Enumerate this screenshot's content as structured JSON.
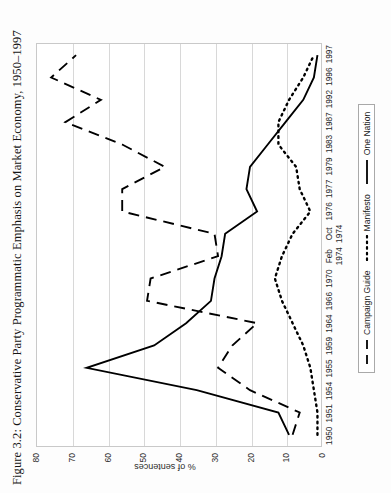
{
  "figure": {
    "title": "Figure 3.2: Conservative Party Programmatic Emphasis on Market Economy, 1950–1997"
  },
  "chart_data": {
    "type": "line",
    "title": "Figure 3.2: Conservative Party Programmatic Emphasis on Market Economy, 1950–1997",
    "xlabel": "",
    "ylabel": "% of sentences",
    "ylim": [
      0,
      80
    ],
    "yticks": [
      0,
      10,
      20,
      30,
      40,
      50,
      60,
      70,
      80
    ],
    "grid": true,
    "legend_position": "bottom-center",
    "categories": [
      "1950",
      "1951",
      "1954",
      "1955",
      "1959",
      "1964",
      "1966",
      "1970",
      "Feb\n1974",
      "Oct\n1974",
      "1976",
      "1977",
      "1979",
      "1983",
      "1987",
      "1992",
      "1996",
      "1997"
    ],
    "series": [
      {
        "name": "Campaign Guide",
        "style": "dashed",
        "color": "#000000",
        "values": [
          8,
          6,
          20,
          29,
          25,
          18,
          49,
          48,
          29,
          30,
          56,
          56,
          44,
          56,
          72,
          62,
          76,
          69
        ]
      },
      {
        "name": "Manifesto",
        "style": "dotted",
        "color": "#000000",
        "values": [
          1,
          1,
          2,
          3,
          5,
          8,
          11,
          13,
          11,
          8,
          3,
          6,
          7,
          12,
          12,
          9,
          5,
          2
        ]
      },
      {
        "name": "One Nation",
        "style": "solid",
        "color": "#000000",
        "values": [
          9,
          12,
          35,
          66,
          47,
          38,
          31,
          30,
          28,
          27,
          18,
          21,
          20,
          15,
          10,
          5,
          2,
          1
        ]
      }
    ]
  },
  "axes": {
    "y_tick_labels": [
      "0",
      "10",
      "20",
      "30",
      "40",
      "50",
      "60",
      "70",
      "80"
    ],
    "y_label": "% of sentences",
    "x_tick_labels": [
      "1950",
      "1951",
      "1954",
      "1955",
      "1959",
      "1964",
      "1966",
      "1970",
      "Feb\n1974",
      "Oct\n1974",
      "1976",
      "1977",
      "1979",
      "1983",
      "1987",
      "1992",
      "1996",
      "1997"
    ]
  },
  "legend": {
    "entries": [
      {
        "label": "Campaign Guide",
        "style": "dashed"
      },
      {
        "label": "Manifesto",
        "style": "dotted"
      },
      {
        "label": "One Nation",
        "style": "solid"
      }
    ]
  }
}
